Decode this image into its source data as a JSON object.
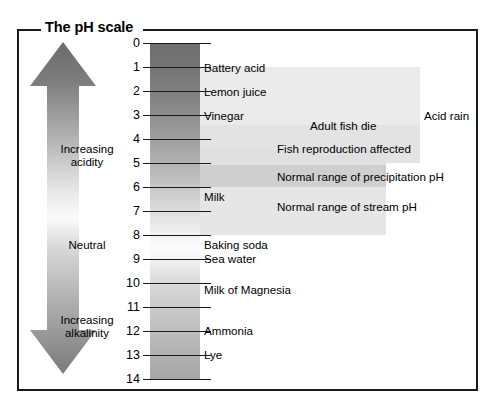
{
  "figure": {
    "title": "The pH scale",
    "frame_color": "#1a1a1a",
    "background": "#ffffff"
  },
  "axis": {
    "label": "pH",
    "ticks": [
      0,
      1,
      2,
      3,
      4,
      5,
      6,
      7,
      8,
      9,
      10,
      11,
      12,
      13,
      14
    ],
    "tick_labels": [
      "0",
      "1",
      "2",
      "3",
      "4",
      "5",
      "6",
      "7",
      "8",
      "9",
      "10",
      "11",
      "12",
      "13",
      "14"
    ],
    "orientation": "vertical",
    "direction": "acidic-top-to-alkaline-bottom"
  },
  "arrow": {
    "type": "double-headed-vertical",
    "top_label": "Increasing\nacidity",
    "top_label_line1": "Increasing",
    "top_label_line2": "acidity",
    "middle_label": "Neutral",
    "bottom_label_line1": "Increasing",
    "bottom_label_line2": "alkalinity",
    "gradient_dark": "#6b6b6b",
    "gradient_light": "#f4f4f4"
  },
  "column": {
    "gradient_top_color": "#6e6e6e",
    "gradient_mid_color": "#fdfdfd",
    "gradient_bottom_color": "#a6a6a6"
  },
  "substances": [
    {
      "name": "Battery acid",
      "ph": 1.0
    },
    {
      "name": "Lemon juice",
      "ph": 2.0
    },
    {
      "name": "Vinegar",
      "ph": 3.0
    },
    {
      "name": "Milk",
      "ph": 6.5
    },
    {
      "name": "Baking soda",
      "ph": 8.5
    },
    {
      "name": "Sea water",
      "ph": 9.0
    },
    {
      "name": "Milk of Magnesia",
      "ph": 10.5
    },
    {
      "name": "Ammonia",
      "ph": 12.0
    },
    {
      "name": "Lye",
      "ph": 13.0
    }
  ],
  "bands": [
    {
      "name": "Acid rain",
      "ph_from": 1.0,
      "ph_to": 5.0,
      "shade": "#ebebeb"
    },
    {
      "name": "Adult fish die",
      "ph_from": 3.4,
      "ph_to": 5.0,
      "shade": "#e3e3e3"
    },
    {
      "name": "Fish reproduction affected",
      "ph_from": 4.4,
      "ph_to": 5.8,
      "shade": "#e0e0e0"
    },
    {
      "name": "Normal range of precipitation pH",
      "ph_from": 5.1,
      "ph_to": 6.2,
      "shade": "#cfcfcf"
    },
    {
      "name": "Normal range of stream pH",
      "ph_from": 6.0,
      "ph_to": 8.0,
      "shade": "#e6e6e6"
    }
  ],
  "chart_data": {
    "type": "bar",
    "title": "The pH scale",
    "xlabel": "",
    "ylabel": "pH",
    "ylim": [
      0,
      14
    ],
    "grid": false,
    "legend": "none",
    "categories": [
      "Battery acid",
      "Lemon juice",
      "Vinegar",
      "Milk",
      "Baking soda",
      "Sea water",
      "Milk of Magnesia",
      "Ammonia",
      "Lye"
    ],
    "values": [
      1.0,
      2.0,
      3.0,
      6.5,
      8.5,
      9.0,
      10.5,
      12.0,
      13.0
    ],
    "annotations": [
      {
        "text": "Acid rain",
        "range": [
          1.0,
          5.0
        ]
      },
      {
        "text": "Adult fish die",
        "range": [
          3.4,
          5.0
        ]
      },
      {
        "text": "Fish reproduction affected",
        "range": [
          4.4,
          5.8
        ]
      },
      {
        "text": "Normal range of precipitation pH",
        "range": [
          5.1,
          6.2
        ]
      },
      {
        "text": "Normal range of stream pH",
        "range": [
          6.0,
          8.0
        ]
      },
      {
        "text": "Increasing acidity",
        "range": [
          0,
          7
        ]
      },
      {
        "text": "Neutral",
        "range": [
          7,
          7
        ]
      },
      {
        "text": "Increasing alkalinity",
        "range": [
          7,
          14
        ]
      }
    ]
  }
}
